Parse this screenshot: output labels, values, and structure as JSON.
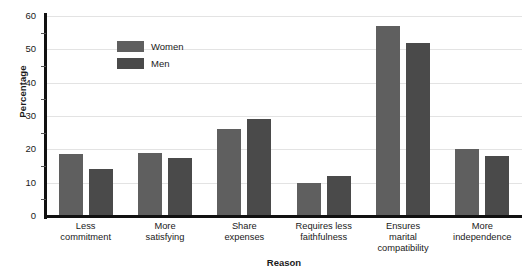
{
  "chart_data": {
    "type": "bar",
    "title": "",
    "xlabel": "Reason",
    "ylabel": "Percentage",
    "ylim": [
      0,
      60
    ],
    "y_ticks": [
      0,
      10,
      20,
      30,
      40,
      50,
      60
    ],
    "y_minor_tick_step": 5,
    "grid": true,
    "legend_position": "upper-left-inside",
    "categories": [
      "Less\ncommitment",
      "More\nsatisfying",
      "Share\nexpenses",
      "Requires less\nfaithfulness",
      "Ensures\nmarital\ncompatibility",
      "More\nindependence"
    ],
    "category_lines": [
      [
        "Less",
        "commitment"
      ],
      [
        "More",
        "satisfying"
      ],
      [
        "Share",
        "expenses"
      ],
      [
        "Requires less",
        "faithfulness"
      ],
      [
        "Ensures",
        "marital",
        "compatibility"
      ],
      [
        "More",
        "independence"
      ]
    ],
    "series": [
      {
        "name": "Women",
        "color": "#5f5f5f",
        "values": [
          18.5,
          19,
          26,
          10,
          57,
          20
        ]
      },
      {
        "name": "Men",
        "color": "#4a4a4a",
        "values": [
          14,
          17.5,
          29,
          12,
          52,
          18
        ]
      }
    ]
  },
  "legend": {
    "items": [
      {
        "label": "Women",
        "color": "#5f5f5f"
      },
      {
        "label": "Men",
        "color": "#4a4a4a"
      }
    ]
  },
  "axes": {
    "y_title": "Percentage",
    "x_title": "Reason",
    "y_tick_labels": [
      "0",
      "10",
      "20",
      "30",
      "40",
      "50",
      "60"
    ]
  }
}
